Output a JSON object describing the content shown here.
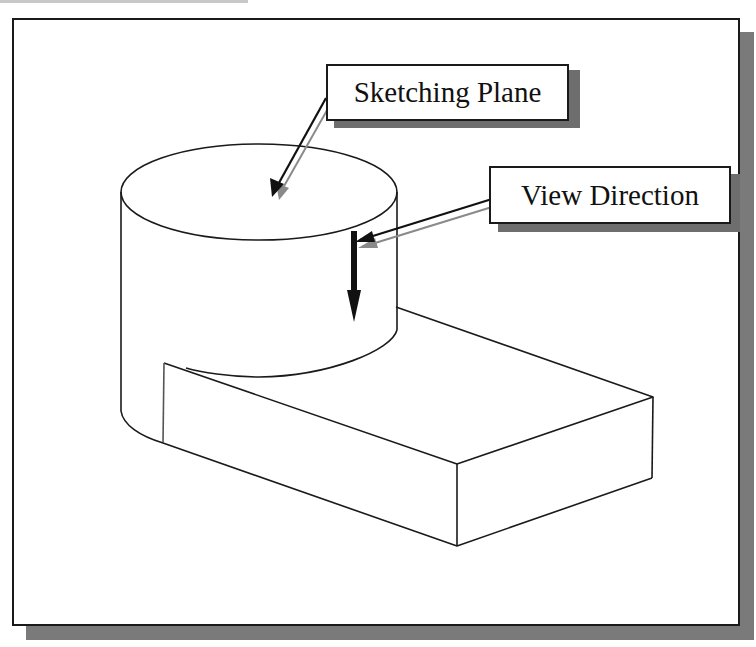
{
  "figure": {
    "type": "isometric-sketch"
  },
  "labels": {
    "sketching_plane": "Sketching Plane",
    "view_direction": "View Direction"
  },
  "colors": {
    "line": "#1a1a1a",
    "shadow": "#7a7a7a",
    "arrow_shadow": "#8a8a8a",
    "background": "#ffffff"
  }
}
